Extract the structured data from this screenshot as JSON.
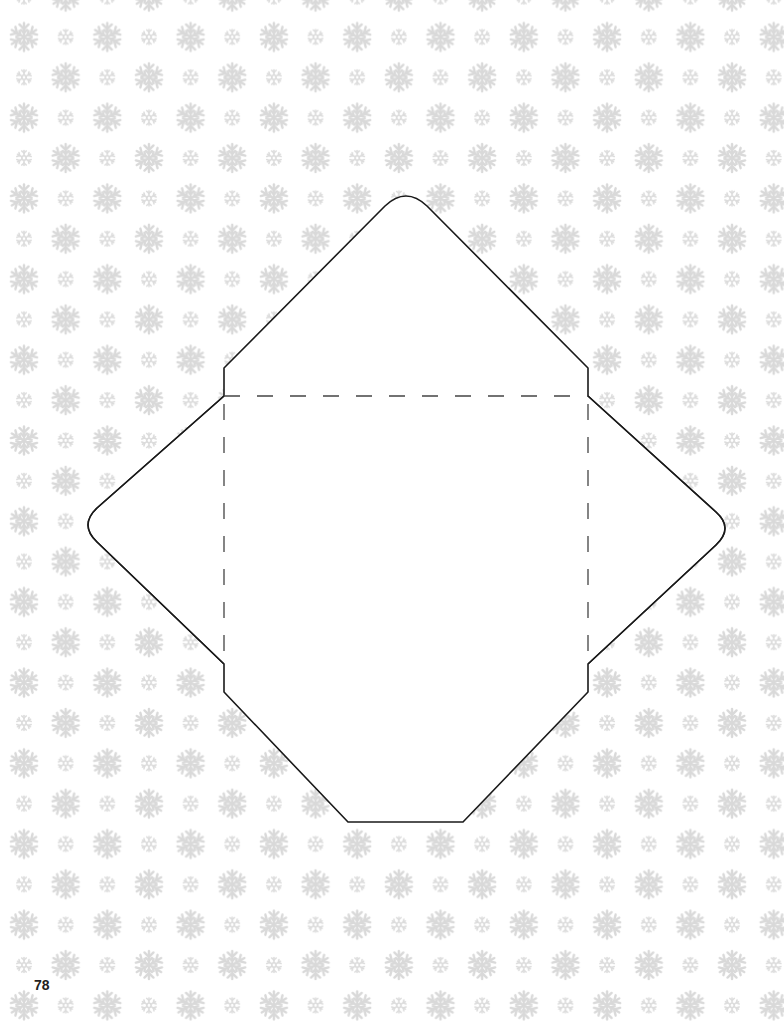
{
  "page": {
    "number": "78",
    "background_color": "#ffffff"
  },
  "pattern": {
    "name": "snowflake-grid",
    "snowflake_color": "#d9d9d9",
    "col_spacing": 83.3,
    "row_spacing": 40.35,
    "first_row_y": 37,
    "first_col_x": 24,
    "large_size": 30,
    "small_size": 16
  },
  "envelope_template": {
    "cut_line_color": "#1a1a1a",
    "fold_line_color": "#444444",
    "fold_line_style": "dashed",
    "body": {
      "left": 224,
      "right": 588,
      "top": 396,
      "bottom": 664
    },
    "top_flap_peak": {
      "x": 406,
      "y": 195
    },
    "left_flap_tip": {
      "x": 87,
      "y": 527
    },
    "right_flap_tip": {
      "x": 726,
      "y": 530
    },
    "bottom_flap": {
      "left_x": 348,
      "right_x": 463,
      "y": 822
    }
  }
}
